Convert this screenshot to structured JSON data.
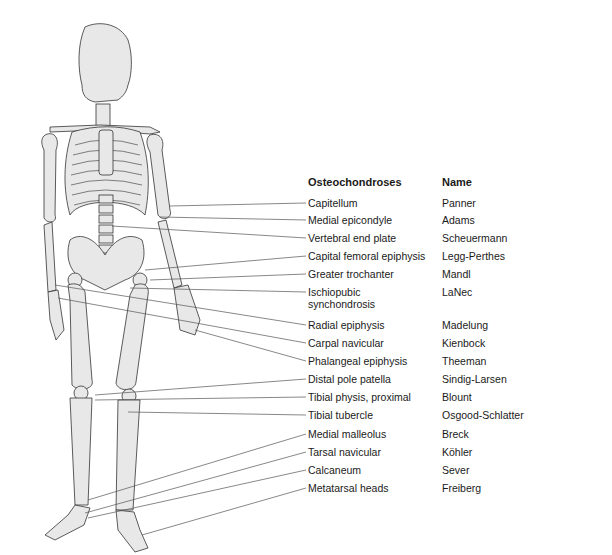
{
  "figure": {
    "header": {
      "condition_col": "Osteochondroses",
      "name_col": "Name"
    },
    "rows": [
      {
        "site": "Capitellum",
        "name": "Panner",
        "y": 197
      },
      {
        "site": "Medial epicondyle",
        "name": "Adams",
        "y": 214
      },
      {
        "site": "Vertebral end plate",
        "name": "Scheuermann",
        "y": 232
      },
      {
        "site": "Capital femoral epiphysis",
        "name": "Legg-Perthes",
        "y": 250
      },
      {
        "site": "Greater trochanter",
        "name": "Mandl",
        "y": 268
      },
      {
        "site": "Ischiopubic\nsynchondrosis",
        "name": "LaNec",
        "y": 286
      },
      {
        "site": "Radial epiphysis",
        "name": "Madelung",
        "y": 319
      },
      {
        "site": "Carpal navicular",
        "name": "Kienbock",
        "y": 337
      },
      {
        "site": "Phalangeal epiphysis",
        "name": "Theeman",
        "y": 355
      },
      {
        "site": "Distal pole patella",
        "name": "Sindig-Larsen",
        "y": 373
      },
      {
        "site": "Tibial physis, proximal",
        "name": "Blount",
        "y": 391
      },
      {
        "site": "Tibial tubercle",
        "name": "Osgood-Schlatter",
        "y": 409
      },
      {
        "site": "Medial malleolus",
        "name": "Breck",
        "y": 428
      },
      {
        "site": "Tarsal navicular",
        "name": "Köhler",
        "y": 446
      },
      {
        "site": "Calcaneum",
        "name": "Sever",
        "y": 464
      },
      {
        "site": "Metatarsal heads",
        "name": "Freiberg",
        "y": 482
      }
    ]
  },
  "colors": {
    "bone_fill": "#e8e8e8",
    "bone_stroke": "#333333",
    "leader_line": "#555555"
  }
}
